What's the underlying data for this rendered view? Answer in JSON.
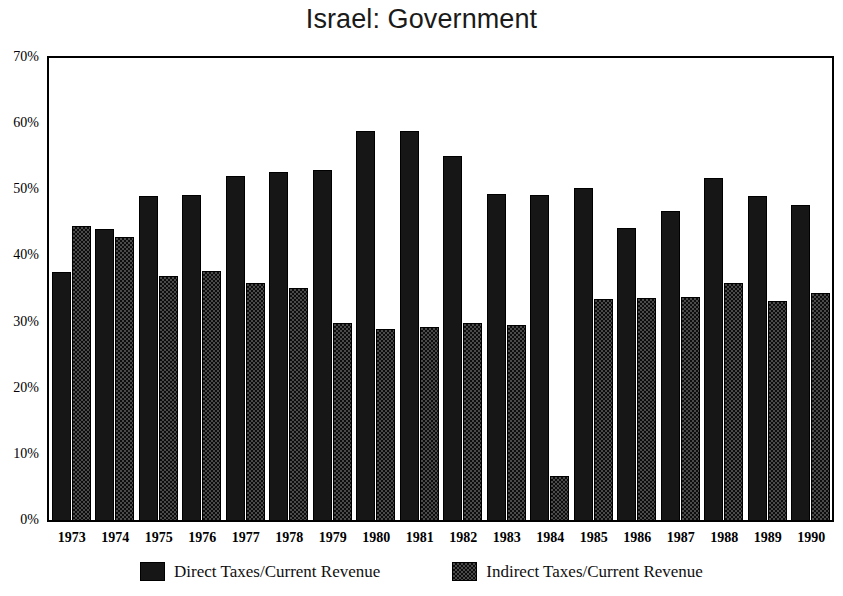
{
  "chart_data": {
    "type": "bar",
    "title": "Israel: Government",
    "xlabel": "",
    "ylabel": "",
    "ylim": [
      0,
      70
    ],
    "ytick_labels": [
      "0%",
      "10%",
      "20%",
      "30%",
      "40%",
      "50%",
      "60%",
      "70%"
    ],
    "ytick_values": [
      0,
      10,
      20,
      30,
      40,
      50,
      60,
      70
    ],
    "grid": false,
    "legend_position": "bottom",
    "categories": [
      "1973",
      "1974",
      "1975",
      "1976",
      "1977",
      "1978",
      "1979",
      "1980",
      "1981",
      "1982",
      "1983",
      "1984",
      "1985",
      "1986",
      "1987",
      "1988",
      "1989",
      "1990"
    ],
    "series": [
      {
        "name": "Direct Taxes/Current Revenue",
        "color": "#161616",
        "values": [
          37.7,
          44.2,
          49.2,
          49.3,
          52.1,
          52.7,
          53.1,
          59.0,
          59.0,
          55.2,
          49.5,
          49.3,
          50.3,
          44.3,
          46.8,
          51.8,
          49.2,
          47.8
        ]
      },
      {
        "name": "Indirect Taxes/Current Revenue",
        "color": "#4a4a4a",
        "values": [
          44.6,
          42.9,
          37.0,
          37.8,
          36.0,
          35.3,
          30.0,
          29.1,
          29.3,
          30.0,
          29.7,
          6.8,
          33.5,
          33.7,
          33.9,
          36.0,
          33.3,
          34.4
        ]
      }
    ]
  },
  "legend": {
    "items": [
      {
        "label": "Direct Taxes/Current Revenue",
        "swatch": "swatch-direct"
      },
      {
        "label": "Indirect Taxes/Current Revenue",
        "swatch": "swatch-indirect"
      }
    ]
  }
}
